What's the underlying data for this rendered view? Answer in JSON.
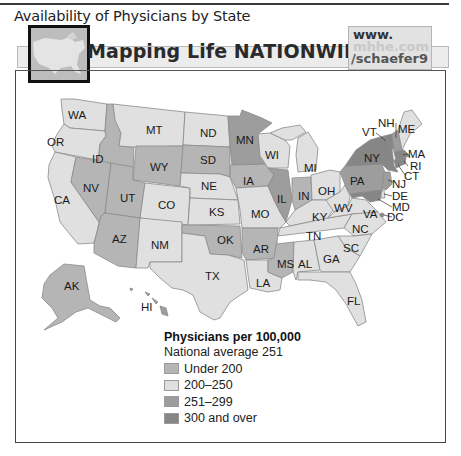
{
  "figure": {
    "title": "Availability of Physicians by State"
  },
  "banner": {
    "title": "Mapping Life NATIONWIDE",
    "url_line1": "www.",
    "url_line2": "mhhe.com",
    "url_line3": "/schaefer9"
  },
  "colors": {
    "under_200": "#b5b5b5",
    "200_250": "#e0e0e0",
    "251_299": "#9d9d9d",
    "300_over": "#868686",
    "border": "#8a8a8a"
  },
  "legend": {
    "title": "Physicians per 100,000",
    "subtitle": "National average 251",
    "items": [
      {
        "label": "Under 200",
        "color": "#b5b5b5"
      },
      {
        "label": "200–250",
        "color": "#e0e0e0"
      },
      {
        "label": "251–299",
        "color": "#9d9d9d"
      },
      {
        "label": "300 and over",
        "color": "#868686"
      }
    ]
  },
  "states": {
    "WA": {
      "label": "WA",
      "category": "200–250"
    },
    "OR": {
      "label": "OR",
      "category": "200–250"
    },
    "CA": {
      "label": "CA",
      "category": "200–250"
    },
    "ID": {
      "label": "ID",
      "category": "Under 200"
    },
    "NV": {
      "label": "NV",
      "category": "Under 200"
    },
    "MT": {
      "label": "MT",
      "category": "200–250"
    },
    "WY": {
      "label": "WY",
      "category": "Under 200"
    },
    "UT": {
      "label": "UT",
      "category": "Under 200"
    },
    "CO": {
      "label": "CO",
      "category": "200–250"
    },
    "AZ": {
      "label": "AZ",
      "category": "Under 200"
    },
    "NM": {
      "label": "NM",
      "category": "200–250"
    },
    "ND": {
      "label": "ND",
      "category": "200–250"
    },
    "SD": {
      "label": "SD",
      "category": "Under 200"
    },
    "NE": {
      "label": "NE",
      "category": "200–250"
    },
    "KS": {
      "label": "KS",
      "category": "200–250"
    },
    "OK": {
      "label": "OK",
      "category": "Under 200"
    },
    "TX": {
      "label": "TX",
      "category": "200–250"
    },
    "MN": {
      "label": "MN",
      "category": "251–299"
    },
    "IA": {
      "label": "IA",
      "category": "Under 200"
    },
    "MO": {
      "label": "MO",
      "category": "200–250"
    },
    "AR": {
      "label": "AR",
      "category": "Under 200"
    },
    "LA": {
      "label": "LA",
      "category": "200–250"
    },
    "WI": {
      "label": "WI",
      "category": "200–250"
    },
    "IL": {
      "label": "IL",
      "category": "251–299"
    },
    "MI": {
      "label": "MI",
      "category": "200–250"
    },
    "IN": {
      "label": "IN",
      "category": "Under 200"
    },
    "OH": {
      "label": "OH",
      "category": "200–250"
    },
    "KY": {
      "label": "KY",
      "category": "200–250"
    },
    "TN": {
      "label": "TN",
      "category": "200–250"
    },
    "MS": {
      "label": "MS",
      "category": "Under 200"
    },
    "AL": {
      "label": "AL",
      "category": "200–250"
    },
    "WV": {
      "label": "WV",
      "category": "200–250"
    },
    "VA": {
      "label": "VA",
      "category": "200–250"
    },
    "NC": {
      "label": "NC",
      "category": "200–250"
    },
    "SC": {
      "label": "SC",
      "category": "200–250"
    },
    "GA": {
      "label": "GA",
      "category": "200–250"
    },
    "FL": {
      "label": "FL",
      "category": "200–250"
    },
    "PA": {
      "label": "PA",
      "category": "251–299"
    },
    "NY": {
      "label": "NY",
      "category": "300 and over"
    },
    "VT": {
      "label": "VT",
      "category": "300 and over"
    },
    "NH": {
      "label": "NH",
      "category": "251–299"
    },
    "ME": {
      "label": "ME",
      "category": "200–250"
    },
    "MA": {
      "label": "MA",
      "category": "300 and over"
    },
    "RI": {
      "label": "RI",
      "category": "300 and over"
    },
    "CT": {
      "label": "CT",
      "category": "300 and over"
    },
    "NJ": {
      "label": "NJ",
      "category": "251–299"
    },
    "DE": {
      "label": "DE",
      "category": "200–250"
    },
    "MD": {
      "label": "MD",
      "category": "300 and over"
    },
    "DC": {
      "label": "DC",
      "category": "300 and over"
    },
    "AK": {
      "label": "AK",
      "category": "Under 200"
    },
    "HI": {
      "label": "HI",
      "category": "251–299"
    }
  }
}
